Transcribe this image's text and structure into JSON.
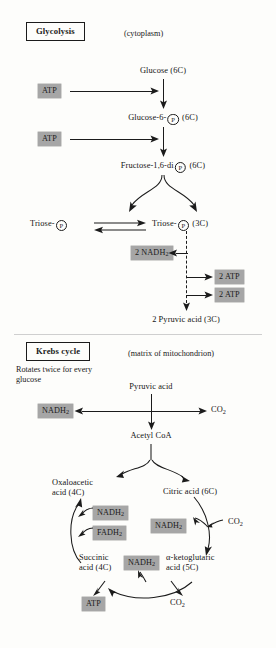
{
  "glycolysis": {
    "title": "Glycolysis",
    "location": "(cytoplasm)",
    "substrates": {
      "glucose": "Glucose (6C)",
      "glucose6p_pre": "Glucose-6-",
      "glucose6p_post": "(6C)",
      "fructose_pre": "Fructose-1,6-di",
      "fructose_post": "(6C)",
      "triose_left": "Triose-",
      "triose_right": "Triose-",
      "triose_carbons": "(3C)",
      "pyruvic": "2 Pyruvic acid (3C)"
    },
    "inputs": [
      {
        "label": "ATP"
      },
      {
        "label": "ATP"
      }
    ],
    "outputs": {
      "nadh": "2 NADH",
      "nadh_sub": "2",
      "atp_1": "2 ATP",
      "atp_2": "2 ATP"
    },
    "p_glyph": "P"
  },
  "krebs": {
    "title": "Krebs cycle",
    "location": "(matrix of mitochondrion)",
    "note": "Rotates twice for every glucose",
    "pyruvic": "Pyruvic acid",
    "nadh_entry": "NADH",
    "nadh_entry_sub": "2",
    "co2_entry": "CO",
    "co2_entry_sub": "2",
    "acetyl": "Acetyl CoA",
    "intermediates": {
      "oxaloacetic_l1": "Oxaloacetic",
      "oxaloacetic_l2": "acid (4C)",
      "citric": "Citric acid (6C)",
      "ketoglutaric_l1": "α-ketoglutaric",
      "ketoglutaric_l2": "acid (5C)",
      "succinic_l1": "Succinic",
      "succinic_l2": "acid (4C)"
    },
    "carriers": {
      "nadh_left": "NADH",
      "nadh_left_sub": "2",
      "fadh_left": "FADH",
      "fadh_left_sub": "2",
      "nadh_right": "NADH",
      "nadh_right_sub": "2",
      "nadh_bottom": "NADH",
      "nadh_bottom_sub": "2",
      "atp_bottom": "ATP"
    },
    "co2_right": "CO",
    "co2_right_sub": "2",
    "co2_bottom": "CO",
    "co2_bottom_sub": "2"
  },
  "colors": {
    "chip_grey": "#a6a6a6",
    "ink": "#1b1b1b",
    "paper": "#fdfdfb"
  }
}
